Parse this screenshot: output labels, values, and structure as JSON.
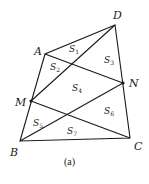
{
  "figure": {
    "caption": "(a)",
    "points": {
      "A": {
        "label": "A",
        "x": 45,
        "y": 54
      },
      "B": {
        "label": "B",
        "x": 20,
        "y": 141
      },
      "C": {
        "label": "C",
        "x": 130,
        "y": 138
      },
      "D": {
        "label": "D",
        "x": 115,
        "y": 25
      },
      "M": {
        "label": "M",
        "x": 31,
        "y": 101
      },
      "N": {
        "label": "N",
        "x": 123,
        "y": 83
      }
    },
    "regions": [
      {
        "name": "S",
        "sub": "1"
      },
      {
        "name": "S",
        "sub": "2"
      },
      {
        "name": "S",
        "sub": "3"
      },
      {
        "name": "S",
        "sub": "4"
      },
      {
        "name": "S",
        "sub": "5"
      },
      {
        "name": "S",
        "sub": "6"
      },
      {
        "name": "S",
        "sub": "7"
      }
    ],
    "segments": [
      "AB",
      "BC",
      "CD",
      "DA",
      "AN",
      "MD",
      "MC",
      "BN"
    ]
  }
}
